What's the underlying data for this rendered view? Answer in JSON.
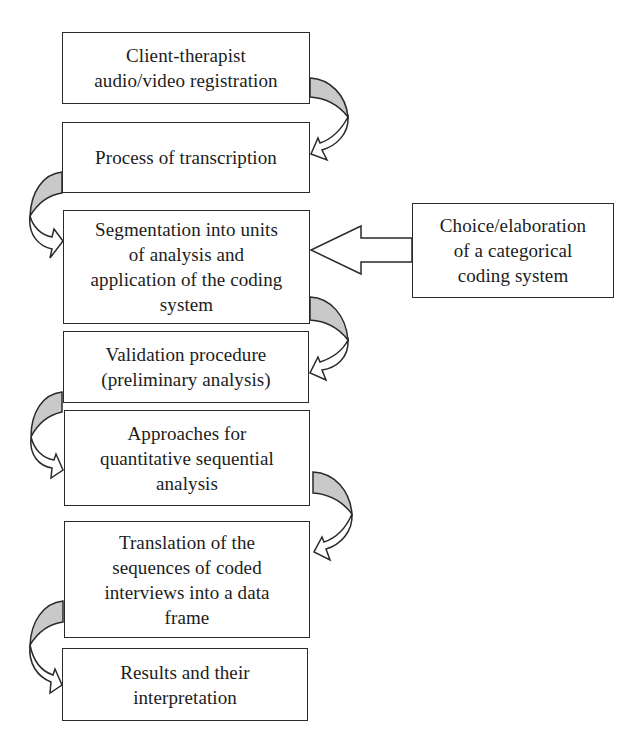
{
  "diagram": {
    "type": "flowchart",
    "steps": [
      {
        "id": "step1",
        "label": "Client-therapist\naudio/video registration",
        "box": {
          "x": 62,
          "y": 32,
          "w": 248,
          "h": 72
        }
      },
      {
        "id": "step2",
        "label": "Process of transcription",
        "box": {
          "x": 62,
          "y": 122,
          "w": 248,
          "h": 71
        }
      },
      {
        "id": "step3",
        "label": "Segmentation into units\nof analysis and\napplication of the coding\nsystem",
        "box": {
          "x": 63,
          "y": 210,
          "w": 247,
          "h": 114
        }
      },
      {
        "id": "step4",
        "label": "Validation procedure\n(preliminary analysis)",
        "box": {
          "x": 63,
          "y": 331,
          "w": 246,
          "h": 72
        }
      },
      {
        "id": "step5",
        "label": "Approaches for\nquantitative sequential\nanalysis",
        "box": {
          "x": 64,
          "y": 410,
          "w": 246,
          "h": 96
        }
      },
      {
        "id": "step6",
        "label": "Translation of the\nsequences of coded\ninterviews into a data\nframe",
        "box": {
          "x": 64,
          "y": 521,
          "w": 246,
          "h": 117
        }
      },
      {
        "id": "step7",
        "label": "Results and their\ninterpretation",
        "box": {
          "x": 62,
          "y": 648,
          "w": 246,
          "h": 73
        }
      }
    ],
    "side_input": {
      "id": "coding-system",
      "label": "Choice/elaboration\nof a categorical\ncoding system",
      "box": {
        "x": 412,
        "y": 203,
        "w": 202,
        "h": 95
      },
      "target": "step3"
    },
    "edges": [
      {
        "from": "step1",
        "to": "step2",
        "side": "right"
      },
      {
        "from": "step2",
        "to": "step3",
        "side": "left"
      },
      {
        "from": "step3",
        "to": "step4",
        "side": "right"
      },
      {
        "from": "step4",
        "to": "step5",
        "side": "left"
      },
      {
        "from": "step5",
        "to": "step6",
        "side": "right"
      },
      {
        "from": "step6",
        "to": "step7",
        "side": "left"
      },
      {
        "from": "coding-system",
        "to": "step3",
        "side": "straight"
      }
    ],
    "colors": {
      "border": "#2a2a2a",
      "arrow_shade": "#c9c9c9",
      "background": "#ffffff",
      "text": "#1c1c1c"
    }
  }
}
